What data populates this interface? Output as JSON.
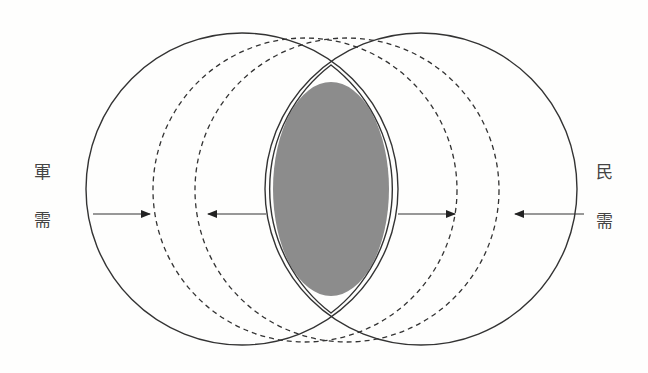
{
  "diagram": {
    "type": "venn-convergence",
    "colors": {
      "stroke": "#333333",
      "overlap_fill": "#8c8c8c",
      "background": "#fefefd",
      "label": "#444444"
    },
    "left_label": {
      "line1": "軍",
      "line2": "需"
    },
    "right_label": {
      "line1": "民",
      "line2": "需"
    },
    "shapes": {
      "left_circle": {
        "style": "solid",
        "cx": 242,
        "cy": 189,
        "r": 156
      },
      "right_circle": {
        "style": "solid",
        "cx": 421,
        "cy": 189,
        "r": 156
      },
      "left_dashed_circle": {
        "style": "dashed",
        "cx": 305,
        "cy": 190,
        "r": 152
      },
      "right_dashed_circle": {
        "style": "dashed",
        "cx": 347,
        "cy": 190,
        "r": 152
      },
      "overlap_ellipse": {
        "style": "filled",
        "cx": 331,
        "cy": 189,
        "rx": 58,
        "ry": 107
      }
    },
    "arrows": [
      {
        "from": 93,
        "to": 150,
        "direction": "right"
      },
      {
        "from": 266,
        "to": 208,
        "direction": "left"
      },
      {
        "from": 398,
        "to": 455,
        "direction": "right"
      },
      {
        "from": 584,
        "to": 515,
        "direction": "left"
      }
    ]
  }
}
